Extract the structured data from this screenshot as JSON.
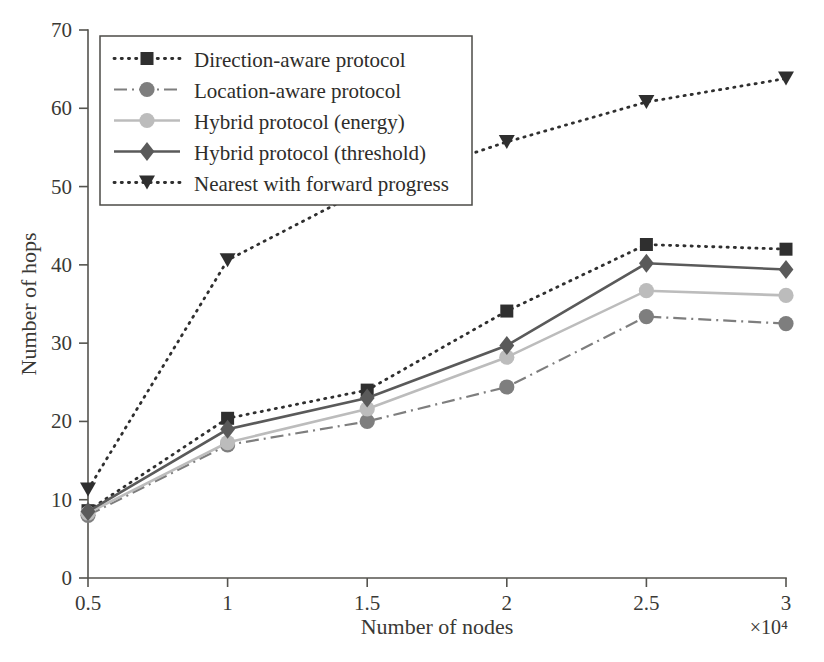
{
  "figure": {
    "background": "#ffffff",
    "axis_color": "#55544f"
  },
  "chart_data": {
    "type": "line",
    "title": "",
    "xlabel": "Number of nodes",
    "ylabel": "Number of hops",
    "x_multiplier": "×10⁴",
    "x": [
      0.5,
      1,
      1.5,
      2,
      2.5,
      3
    ],
    "xticklabels": [
      "0.5",
      "1",
      "1.5",
      "2",
      "2.5",
      "3"
    ],
    "xlim": [
      0.5,
      3
    ],
    "yticklabels": [
      "0",
      "10",
      "20",
      "30",
      "40",
      "50",
      "60",
      "70"
    ],
    "yticks": [
      0,
      10,
      20,
      30,
      40,
      50,
      60,
      70
    ],
    "ylim": [
      0,
      70
    ],
    "grid": false,
    "legend_position": "upper-left",
    "series": [
      {
        "name": "Direction-aware protocol",
        "values": [
          8.6,
          20.4,
          24.0,
          34.1,
          42.6,
          42.0
        ],
        "color": "#2f2f2f",
        "marker": "square",
        "linestyle": "dotted"
      },
      {
        "name": "Location-aware protocol",
        "values": [
          8.0,
          17.0,
          20.0,
          24.4,
          33.4,
          32.5
        ],
        "color": "#7e7e7e",
        "marker": "circle",
        "linestyle": "dashdot"
      },
      {
        "name": "Hybrid protocol (energy)",
        "values": [
          8.3,
          17.3,
          21.6,
          28.2,
          36.7,
          36.1
        ],
        "color": "#bcbcbc",
        "marker": "circle",
        "linestyle": "solid"
      },
      {
        "name": "Hybrid protocol (threshold)",
        "values": [
          8.5,
          19.0,
          23.0,
          29.7,
          40.2,
          39.4
        ],
        "color": "#5a5a5a",
        "marker": "diamond",
        "linestyle": "solid"
      },
      {
        "name": "Nearest with forward progress",
        "values": [
          11.3,
          40.6,
          49.8,
          55.7,
          60.8,
          63.8
        ],
        "color": "#2f2f2f",
        "marker": "triangle-down",
        "linestyle": "dotted"
      }
    ]
  }
}
